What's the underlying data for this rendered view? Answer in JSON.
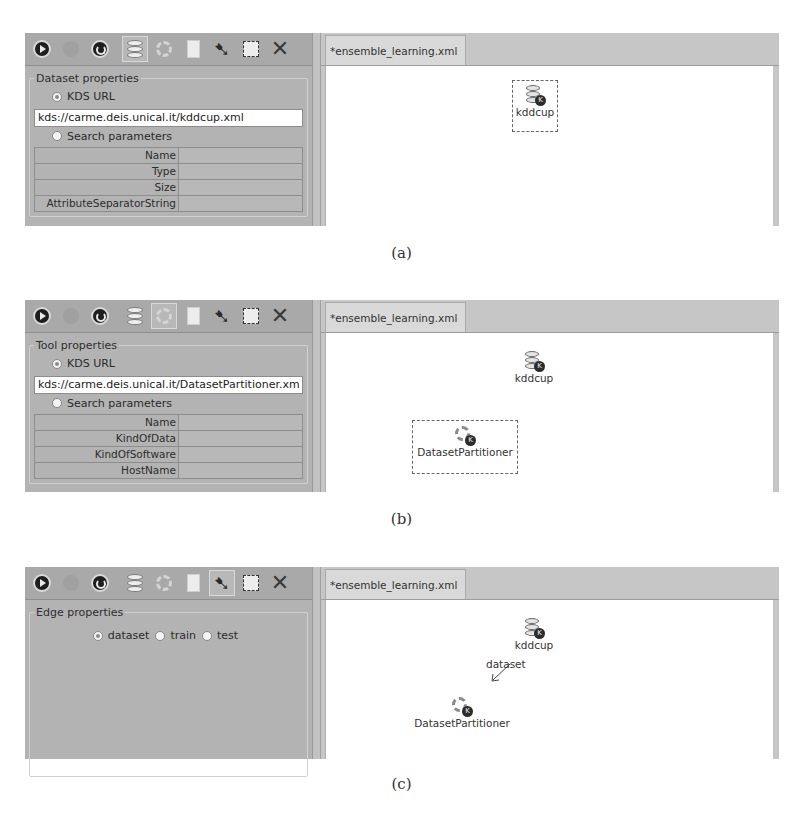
{
  "toolbar": {
    "icons": [
      "play-icon",
      "stop-icon",
      "refresh-icon",
      "dataset-icon",
      "tool-icon",
      "document-icon",
      "edge-arrow-icon",
      "select-icon",
      "delete-icon"
    ]
  },
  "tab_label": "*ensemble_learning.xml",
  "panels": [
    {
      "caption": "(a)",
      "active_tool": "dataset",
      "properties": {
        "legend": "Dataset properties",
        "kds_url_label": "KDS URL",
        "kds_url_value": "kds://carme.deis.unical.it/kddcup.xml",
        "search_label": "Search parameters",
        "params": [
          {
            "key": "Name",
            "value": ""
          },
          {
            "key": "Type",
            "value": ""
          },
          {
            "key": "Size",
            "value": ""
          },
          {
            "key": "AttributeSeparatorString",
            "value": ""
          }
        ]
      },
      "nodes": [
        {
          "label": "kddcup",
          "type": "dataset",
          "selected": true
        }
      ]
    },
    {
      "caption": "(b)",
      "active_tool": "tool",
      "properties": {
        "legend": "Tool properties",
        "kds_url_label": "KDS URL",
        "kds_url_value": "kds://carme.deis.unical.it/DatasetPartitioner.xml",
        "search_label": "Search parameters",
        "params": [
          {
            "key": "Name",
            "value": ""
          },
          {
            "key": "KindOfData",
            "value": ""
          },
          {
            "key": "KindOfSoftware",
            "value": ""
          },
          {
            "key": "HostName",
            "value": ""
          }
        ]
      },
      "nodes": [
        {
          "label": "kddcup",
          "type": "dataset",
          "selected": false
        },
        {
          "label": "DatasetPartitioner",
          "type": "tool",
          "selected": true
        }
      ]
    },
    {
      "caption": "(c)",
      "active_tool": "edge",
      "properties": {
        "legend": "Edge properties",
        "edge_options": [
          {
            "label": "dataset",
            "checked": true
          },
          {
            "label": "train",
            "checked": false
          },
          {
            "label": "test",
            "checked": false
          }
        ]
      },
      "nodes": [
        {
          "label": "kddcup",
          "type": "dataset",
          "selected": false
        },
        {
          "label": "DatasetPartitioner",
          "type": "tool",
          "selected": false
        }
      ],
      "edge": {
        "label": "dataset",
        "from": "kddcup",
        "to": "DatasetPartitioner"
      }
    }
  ]
}
